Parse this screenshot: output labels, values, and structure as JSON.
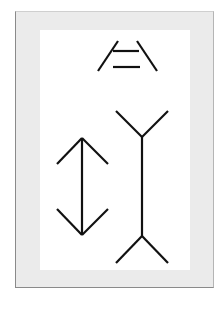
{
  "figure": {
    "title": "",
    "colors": {
      "frame": "#ebebeb",
      "frame_border": "#8a8a8a",
      "panel": "#ffffff",
      "stroke": "#111111"
    },
    "ponzo": {
      "rails": [
        {
          "x1": 98,
          "y1": 71,
          "x2": 118,
          "y2": 41
        },
        {
          "x1": 137,
          "y1": 41,
          "x2": 157,
          "y2": 71
        }
      ],
      "bars": [
        {
          "x1": 113,
          "y1": 51,
          "x2": 139,
          "y2": 51
        },
        {
          "x1": 113,
          "y1": 67,
          "x2": 140,
          "y2": 67
        }
      ]
    },
    "muller_lyer": {
      "arrowheads_figure": {
        "shaft": {
          "x1": 82,
          "y1": 138,
          "x2": 82,
          "y2": 235
        },
        "fins": [
          {
            "x1": 82,
            "y1": 138,
            "x2": 57,
            "y2": 164
          },
          {
            "x1": 82,
            "y1": 138,
            "x2": 108,
            "y2": 164
          },
          {
            "x1": 82,
            "y1": 235,
            "x2": 57,
            "y2": 209
          },
          {
            "x1": 82,
            "y1": 235,
            "x2": 108,
            "y2": 209
          }
        ]
      },
      "tails_figure": {
        "shaft": {
          "x1": 142,
          "y1": 137,
          "x2": 142,
          "y2": 236
        },
        "fins": [
          {
            "x1": 142,
            "y1": 137,
            "x2": 116,
            "y2": 111
          },
          {
            "x1": 142,
            "y1": 137,
            "x2": 168,
            "y2": 111
          },
          {
            "x1": 142,
            "y1": 236,
            "x2": 116,
            "y2": 263
          },
          {
            "x1": 142,
            "y1": 236,
            "x2": 168,
            "y2": 263
          }
        ]
      }
    }
  }
}
